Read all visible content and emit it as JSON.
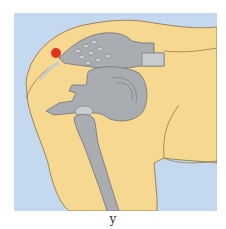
{
  "figure": {
    "caption": "y",
    "colors": {
      "background": "#c4d8ef",
      "skin": "#f7d890",
      "skin_light": "#fbe3a6",
      "outline": "#8a6e3f",
      "bone": "#a9adb1",
      "bone_light": "#c9cccf",
      "bone_outline": "#6e7378",
      "marker": "#e0321e"
    },
    "labels": {
      "marker": "red-marker",
      "pelvis": "pelvis",
      "sacrum": "sacrum",
      "femur": "femur"
    }
  }
}
